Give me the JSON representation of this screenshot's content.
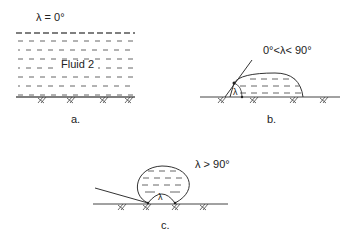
{
  "diagram": {
    "panels": [
      {
        "id": "a",
        "angle_label": "λ  = 0°",
        "fluid_label": "Fluid 2",
        "caption": "a."
      },
      {
        "id": "b",
        "angle_label": "0°<λ< 90°",
        "angle_symbol": "λ",
        "caption": "b."
      },
      {
        "id": "c",
        "angle_label": "λ > 90°",
        "angle_symbol": "λ",
        "caption": "c."
      }
    ],
    "colors": {
      "line": "#333333",
      "dash": "#555555"
    }
  }
}
